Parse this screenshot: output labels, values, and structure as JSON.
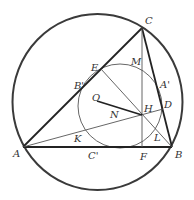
{
  "diagram": {
    "colors": {
      "stroke": "#333333",
      "thin": "#555555",
      "background": "#ffffff"
    },
    "circumcircle": {
      "cx": 97.5,
      "cy": 102,
      "rx": 85,
      "ry": 88
    },
    "nine_point_circle": {
      "cx": 120,
      "cy": 106,
      "r": 42
    },
    "points": {
      "A": {
        "label": "A",
        "x": 23,
        "y": 147
      },
      "B": {
        "label": "B",
        "x": 172,
        "y": 147
      },
      "C": {
        "label": "C",
        "x": 142,
        "y": 28
      },
      "O": {
        "label": "O",
        "x": 97,
        "y": 101
      },
      "H": {
        "label": "H",
        "x": 142,
        "y": 115
      },
      "N": {
        "label": "N",
        "x": 119,
        "y": 108
      },
      "E": {
        "label": "E",
        "x": 101,
        "y": 69
      },
      "F": {
        "label": "F",
        "x": 142,
        "y": 147
      },
      "D": {
        "label": "D",
        "x": 163,
        "y": 109
      },
      "M": {
        "label": "M",
        "x": 142,
        "y": 71
      },
      "A_prime": {
        "label": "A'",
        "x": 157,
        "y": 87
      },
      "B_prime": {
        "label": "B'",
        "x": 82,
        "y": 88
      },
      "C_prime": {
        "label": "C'",
        "x": 97,
        "y": 147
      },
      "K": {
        "label": "K",
        "x": 82,
        "y": 131
      },
      "L": {
        "label": "L",
        "x": 157,
        "y": 131
      }
    },
    "labels": [
      {
        "key": "C",
        "text": "C",
        "x": 145,
        "y": 24
      },
      {
        "key": "E",
        "text": "E",
        "x": 91,
        "y": 71
      },
      {
        "key": "M",
        "text": "M",
        "x": 131,
        "y": 65
      },
      {
        "key": "B_prime",
        "text": "B'",
        "x": 74,
        "y": 89
      },
      {
        "key": "A_prime",
        "text": "A'",
        "x": 160,
        "y": 88
      },
      {
        "key": "O",
        "text": "O",
        "x": 92,
        "y": 101
      },
      {
        "key": "N",
        "text": "N",
        "x": 110,
        "y": 118
      },
      {
        "key": "H",
        "text": "H",
        "x": 144,
        "y": 112
      },
      {
        "key": "D",
        "text": "D",
        "x": 164,
        "y": 108
      },
      {
        "key": "K",
        "text": "K",
        "x": 74,
        "y": 142
      },
      {
        "key": "L",
        "text": "L",
        "x": 154,
        "y": 141
      },
      {
        "key": "A",
        "text": "A",
        "x": 13,
        "y": 157
      },
      {
        "key": "C_prime",
        "text": "C'",
        "x": 88,
        "y": 159
      },
      {
        "key": "F",
        "text": "F",
        "x": 140,
        "y": 160
      },
      {
        "key": "B",
        "text": "B",
        "x": 175,
        "y": 158
      }
    ]
  }
}
